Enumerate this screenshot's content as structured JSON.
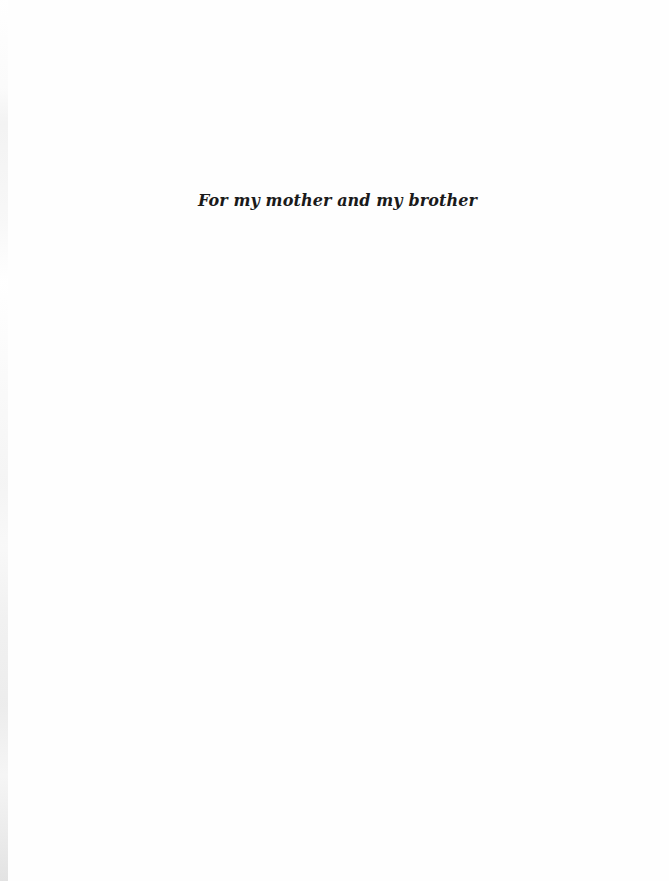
{
  "page": {
    "dedication": "For my mother and my brother"
  },
  "colors": {
    "background": "#fefefe",
    "text": "#1a1a1a"
  }
}
